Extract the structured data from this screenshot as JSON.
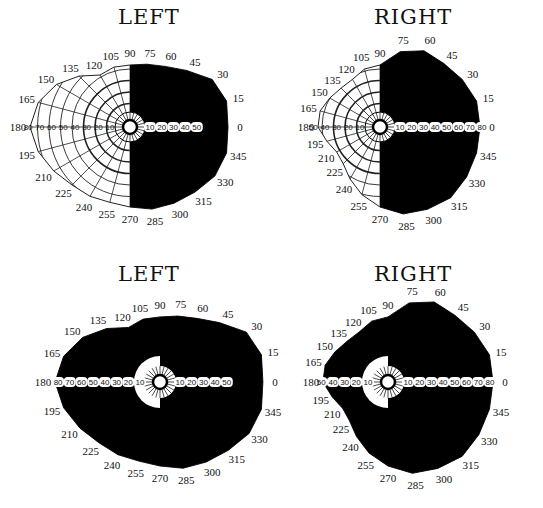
{
  "titles": {
    "top_left": "LEFT",
    "top_right": "RIGHT",
    "bottom_left": "LEFT",
    "bottom_right": "RIGHT"
  },
  "meridian_labels": [
    "0",
    "15",
    "30",
    "45",
    "60",
    "75",
    "90",
    "105",
    "120",
    "135",
    "150",
    "165",
    "180",
    "195",
    "210",
    "225",
    "240",
    "255",
    "270",
    "285",
    "300",
    "315",
    "330",
    "345"
  ],
  "charts": [
    {
      "id": "top-left",
      "eye": "LEFT",
      "blackout": "temporal (right) half field",
      "scale_left": [
        "80",
        "70",
        "60",
        "50",
        "40",
        "30",
        "20",
        "10"
      ],
      "scale_right": [
        "10",
        "20",
        "30",
        "40",
        "50"
      ]
    },
    {
      "id": "top-right",
      "eye": "RIGHT",
      "blackout": "nasal-side right half field",
      "scale_left": [
        "50",
        "40",
        "30",
        "20",
        "10"
      ],
      "scale_right": [
        "10",
        "20",
        "30",
        "40",
        "50",
        "60",
        "70",
        "80"
      ]
    },
    {
      "id": "bottom-left",
      "eye": "LEFT",
      "blackout": "entire field except central sparing",
      "scale_left": [
        "80",
        "70",
        "60",
        "50",
        "40",
        "30",
        "20",
        "10"
      ],
      "scale_right": [
        "10",
        "20",
        "30",
        "40",
        "50"
      ]
    },
    {
      "id": "bottom-right",
      "eye": "RIGHT",
      "blackout": "entire field except central sparing",
      "scale_left": [
        "50",
        "40",
        "30",
        "20",
        "10"
      ],
      "scale_right": [
        "10",
        "20",
        "30",
        "40",
        "50",
        "60",
        "70",
        "80"
      ]
    }
  ],
  "footer": "Fig. 227. Visual field charts"
}
